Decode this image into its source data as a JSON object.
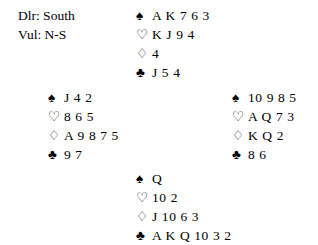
{
  "info": {
    "dealer_line": "Dlr: South",
    "vulnerability_line": "Vul: N-S"
  },
  "suit_symbols": {
    "spades": "♠",
    "hearts": "♡",
    "diamonds": "♢",
    "clubs": "♣"
  },
  "hands": {
    "north": {
      "spades": "A K 7 6 3",
      "hearts": "K J 9 4",
      "diamonds": "4",
      "clubs": "J 5 4"
    },
    "west": {
      "spades": "J 4 2",
      "hearts": "8 6 5",
      "diamonds": "A 9 8 7 5",
      "clubs": "9 7"
    },
    "east": {
      "spades": "10 9 8 5",
      "hearts": "A Q 7 3",
      "diamonds": "K Q 2",
      "clubs": "8 6"
    },
    "south": {
      "spades": "Q",
      "hearts": "10 2",
      "diamonds": "J 10 6 3",
      "clubs": "A K Q 10 3 2"
    }
  },
  "colors": {
    "ink": "#000000",
    "background": "#ffffff"
  }
}
